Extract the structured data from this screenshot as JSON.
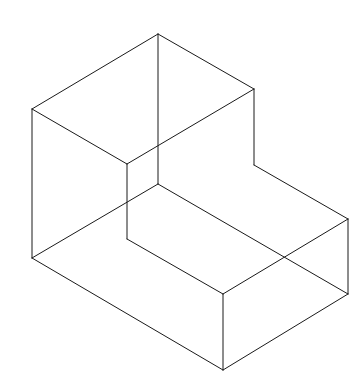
{
  "diagram": {
    "type": "isometric-wireframe",
    "stroke_color": "#1a1a1a",
    "background": "#ffffff",
    "vertices": {
      "A": [
        158,
        34
      ],
      "B": [
        32,
        109
      ],
      "C": [
        254,
        89
      ],
      "D": [
        127,
        164
      ],
      "E": [
        254,
        165
      ],
      "F": [
        158,
        184
      ],
      "G": [
        32,
        258
      ],
      "H": [
        127,
        239
      ],
      "I": [
        348,
        219
      ],
      "J": [
        223,
        294
      ],
      "K": [
        348,
        294
      ],
      "L": [
        223,
        370
      ]
    },
    "edges": [
      [
        "A",
        "B"
      ],
      [
        "A",
        "C"
      ],
      [
        "B",
        "D"
      ],
      [
        "C",
        "D"
      ],
      [
        "A",
        "F"
      ],
      [
        "B",
        "G"
      ],
      [
        "C",
        "E"
      ],
      [
        "D",
        "H"
      ],
      [
        "E",
        "I"
      ],
      [
        "H",
        "J"
      ],
      [
        "I",
        "J"
      ],
      [
        "F",
        "G"
      ],
      [
        "F",
        "K"
      ],
      [
        "G",
        "L"
      ],
      [
        "I",
        "K"
      ],
      [
        "J",
        "L"
      ],
      [
        "K",
        "L"
      ]
    ]
  }
}
